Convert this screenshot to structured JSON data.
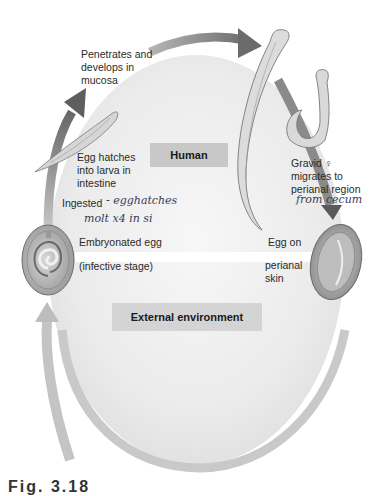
{
  "diagram": {
    "regions": {
      "human": "Human",
      "external": "External environment"
    },
    "labels": {
      "penetrates": [
        "Penetrates and",
        "develops in",
        "mucosa"
      ],
      "hatches": [
        "Egg hatches",
        "into larva in",
        "intestine"
      ],
      "gravid": [
        "Gravid ♀",
        "migrates to",
        "perianal region"
      ],
      "ingested": "Ingested",
      "embryonated": "Embryonated egg",
      "infective": "(infective stage)",
      "egg_on": "Egg on",
      "perianal_skin": [
        "perianal",
        "skin"
      ]
    },
    "handwritten": {
      "ingested_note_1": "- egghatches",
      "ingested_note_2": "molt x4 in si",
      "gravid_note": "from cecum"
    },
    "caption_partial": "Fig. 3.18",
    "colors": {
      "arrow": "#8c8c8c",
      "arrow_light": "#c4c4c4",
      "ellipse_fill": "#ececec",
      "box": "#c8c8c8",
      "divider": "#ffffff"
    }
  }
}
